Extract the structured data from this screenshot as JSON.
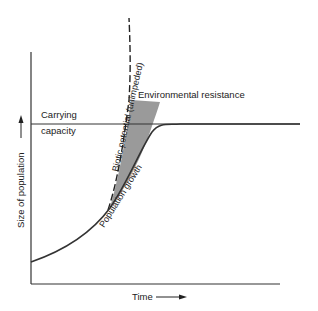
{
  "diagram": {
    "type": "logistic-growth",
    "labels": {
      "carrying_capacity_line1": "Carrying",
      "carrying_capacity_line2": "capacity",
      "environmental_resistance": "Environmental resistance",
      "biotic_potential": "Biotic potential (unimpeded)",
      "population_growth": "Population growth",
      "y_axis": "Size of population",
      "x_axis": "Time"
    },
    "colors": {
      "line": "#333333",
      "shade": "#9a9a9a",
      "background": "#ffffff"
    }
  }
}
